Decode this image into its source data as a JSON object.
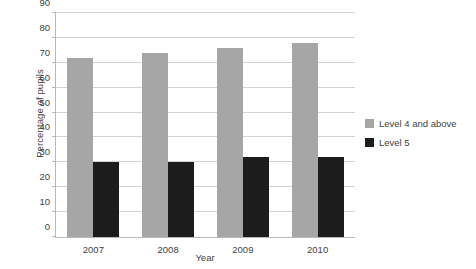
{
  "chart_data": {
    "type": "bar",
    "title": "",
    "subtitle": "",
    "xlabel": "Year",
    "ylabel": "Percentage of pupils",
    "categories": [
      "2007",
      "2008",
      "2009",
      "2010"
    ],
    "series": [
      {
        "name": "Level 4 and above",
        "color": "#a6a6a6",
        "values": [
          72,
          74,
          76,
          78
        ]
      },
      {
        "name": "Level 5",
        "color": "#1c1c1c",
        "values": [
          30,
          30,
          32,
          32
        ]
      }
    ],
    "ylim": [
      0,
      90
    ],
    "ytick_step": 10,
    "yticks": [
      "0",
      "10",
      "20",
      "30",
      "40",
      "50",
      "60",
      "70",
      "80",
      "90"
    ],
    "grid": "horizontal",
    "legend_position": "right",
    "background_color": "#ffffff",
    "axis_color": "#b8b8b8",
    "gridline_color": "#d3d3d3"
  }
}
